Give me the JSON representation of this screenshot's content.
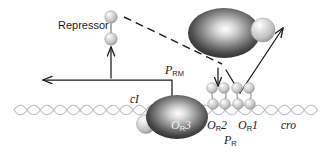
{
  "figure": {
    "name": "lambda-repressor-or-operator-diagram",
    "background": "#ffffff",
    "width": 326,
    "height": 158
  },
  "labels": {
    "repressor": "Repressor",
    "p_rm_base": "P",
    "p_rm_sub": "RM",
    "p_r_base": "P",
    "p_r_sub": "R",
    "ci_gene": "cI",
    "cro_gene": "cro",
    "or3_base": "O",
    "or3_sub": "R",
    "or3_num": "3",
    "or2_base": "O",
    "or2_sub": "R",
    "or2_num": "2",
    "or1_base": "O",
    "or1_sub": "R",
    "or1_num": "1"
  },
  "colors": {
    "dna": "#b9bcc4",
    "protein_dark": "#3a3a3a",
    "protein_light": "#d8d8d8",
    "sphere_light": "#cfcfcf",
    "line": "#1a1a1a",
    "text": "#1a1a1a"
  },
  "elements": {
    "rna_polymerase": "RNA polymerase bound at O R 2",
    "sigma_subunit": "sigma subunit sphere",
    "ci_dimer_or3": "cI repressor dimer bound at O R 3",
    "ci_dimer_or2": "cI repressor dimer bound at O R 2",
    "ci_dimer_or1": "cI repressor dimer bound at O R 1",
    "free_repressor": "free repressor dimer",
    "dna_helix": "double stranded DNA helix",
    "transcription_arrow_left": "leftward transcription arrow from P RM",
    "transcription_arrow_right": "rightward arrow from P R",
    "dashed_inhibition": "dashed line from repressor to polymerase",
    "activation_arrow": "upward arrow to repressor",
    "down_arrow": "downward arrow to O R 1"
  }
}
